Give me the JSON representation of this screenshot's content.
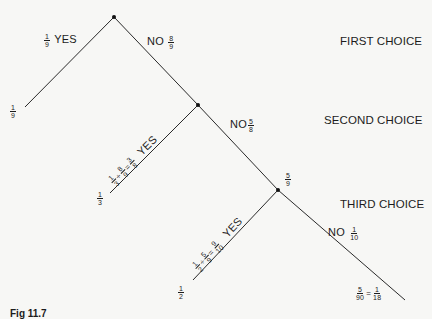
{
  "diagram": {
    "type": "probability-tree",
    "levels": [
      {
        "label": "FIRST CHOICE"
      },
      {
        "label": "SECOND CHOICE"
      },
      {
        "label": "THIRD CHOICE"
      }
    ],
    "branches": {
      "first_yes": {
        "word": "YES",
        "prob": {
          "num": "1",
          "den": "9"
        },
        "leaf": {
          "num": "1",
          "den": "9"
        }
      },
      "first_no": {
        "word": "NO",
        "prob": {
          "num": "8",
          "den": "9"
        }
      },
      "second_yes": {
        "word": "YES",
        "expr": [
          {
            "num": "1",
            "den": "3"
          },
          {
            "op": "÷"
          },
          {
            "num": "8",
            "den": "9"
          },
          {
            "op": "="
          },
          {
            "num": "3",
            "den": "8"
          }
        ],
        "leaf": {
          "num": "1",
          "den": "3"
        }
      },
      "second_no": {
        "word": "NO",
        "prob": {
          "num": "5",
          "den": "8"
        }
      },
      "node3_value": {
        "num": "5",
        "den": "9"
      },
      "third_yes": {
        "word": "YES",
        "expr": [
          {
            "num": "1",
            "den": "2"
          },
          {
            "op": "÷"
          },
          {
            "num": "5",
            "den": "9"
          },
          {
            "op": "="
          },
          {
            "num": "9",
            "den": "10"
          }
        ],
        "leaf": {
          "num": "1",
          "den": "2"
        }
      },
      "third_no": {
        "word": "NO",
        "prob": {
          "num": "1",
          "den": "10"
        }
      },
      "final_leaf": {
        "a": {
          "num": "5",
          "den": "90"
        },
        "op": "=",
        "b": {
          "num": "1",
          "den": "18"
        }
      }
    },
    "caption": "Fig 11.7"
  },
  "colors": {
    "line": "#2a2a2a",
    "background": "#f7f7f5",
    "text": "#1c1c1c"
  }
}
